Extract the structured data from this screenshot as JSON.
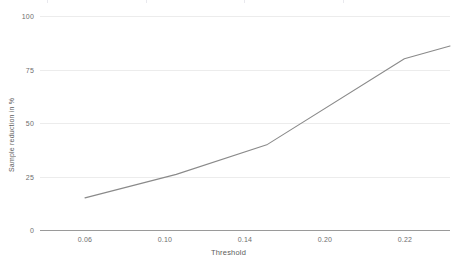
{
  "chart_data": {
    "type": "line",
    "title": "",
    "subtitle": "",
    "xlabel": "Threshold",
    "ylabel": "Sample reduction in %",
    "x": [
      0.06,
      0.1,
      0.14,
      0.2,
      0.22
    ],
    "x_tick_labels": [
      "0.06",
      "0.10",
      "0.14",
      "0.20",
      "0.22"
    ],
    "values": [
      15,
      26,
      40,
      80,
      86
    ],
    "categories": [
      "0.06",
      "0.10",
      "0.14",
      "0.20",
      "0.22"
    ],
    "series": [
      {
        "name": "Sample reduction in %",
        "values": [
          15,
          26,
          40,
          80,
          86
        ]
      }
    ],
    "y_tick_labels": [
      "0",
      "25",
      "50",
      "75",
      "100"
    ],
    "y_ticks": [
      0,
      25,
      50,
      75,
      100
    ],
    "ylim": [
      0,
      100
    ],
    "xlim": [
      0.06,
      0.22
    ],
    "grid": "horizontal",
    "legend": "none",
    "markers": "none",
    "line_color": "#8a8a8a",
    "gridline_color": "#ececec",
    "axis_color": "#9a9a9a",
    "tick_label_color": "#6e6e6e",
    "axis_title_color": "#5d5d5d",
    "background_color": "#ffffff"
  }
}
